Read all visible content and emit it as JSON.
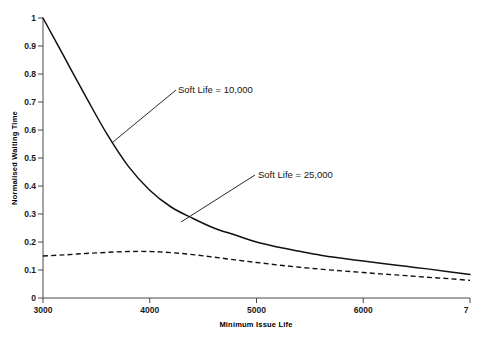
{
  "chart_data": {
    "type": "line",
    "title": "",
    "xlabel": "Minimum Issue Life",
    "ylabel": "Normalised Waiting Time",
    "xlim": [
      3000,
      7000
    ],
    "ylim": [
      0,
      1
    ],
    "xticks": [
      3000,
      4000,
      5000,
      6000,
      7000
    ],
    "xtick_labels": [
      "3000",
      "4000",
      "5000",
      "6000",
      "7"
    ],
    "yticks": [
      0,
      0.1,
      0.2,
      0.3,
      0.4,
      0.5,
      0.6,
      0.7,
      0.8,
      0.9,
      1
    ],
    "ytick_labels": [
      "0",
      "0.1",
      "0.2",
      "0.3",
      "0.4",
      "0.5",
      "0.6",
      "0.7",
      "0.8",
      "0.9",
      "1"
    ],
    "grid": false,
    "legend_position": "annotations-inline",
    "x": [
      3000,
      3200,
      3400,
      3600,
      3800,
      4000,
      4200,
      4400,
      4600,
      4800,
      5000,
      5200,
      5400,
      5600,
      5800,
      6000,
      6200,
      6400,
      6600,
      6800,
      7000
    ],
    "series": [
      {
        "name": "Soft Life = 10,000",
        "style": "solid",
        "color": "#111111",
        "values": [
          1.0,
          0.86,
          0.72,
          0.585,
          0.47,
          0.385,
          0.325,
          0.285,
          0.25,
          0.225,
          0.2,
          0.182,
          0.167,
          0.153,
          0.142,
          0.132,
          0.122,
          0.113,
          0.104,
          0.094,
          0.084
        ]
      },
      {
        "name": "Soft Life = 25,000",
        "style": "dashed",
        "color": "#111111",
        "values": [
          0.15,
          0.154,
          0.159,
          0.163,
          0.166,
          0.166,
          0.162,
          0.155,
          0.146,
          0.136,
          0.127,
          0.118,
          0.11,
          0.103,
          0.097,
          0.091,
          0.085,
          0.08,
          0.074,
          0.069,
          0.063
        ]
      }
    ],
    "annotations": [
      {
        "text": "Soft Life = 10,000",
        "label_x": 178,
        "label_y": 93,
        "leader_from_x": 113,
        "leader_from_y": 142,
        "leader_to_x": 176,
        "leader_to_y": 90
      },
      {
        "text": "Soft Life = 25,000",
        "label_x": 258,
        "label_y": 178,
        "leader_from_x": 181,
        "leader_from_y": 222,
        "leader_to_x": 255,
        "leader_to_y": 175
      }
    ]
  }
}
